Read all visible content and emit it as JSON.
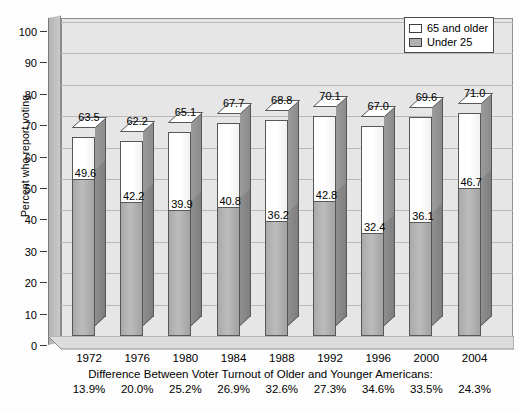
{
  "chart_data": {
    "type": "bar",
    "subtype": "stacked-3d-column",
    "title": "",
    "xlabel": "",
    "ylabel": "Percent who report voting",
    "ylim": [
      0,
      100
    ],
    "ytick_step": 10,
    "yticks": [
      0,
      10,
      20,
      30,
      40,
      50,
      60,
      70,
      80,
      90,
      100
    ],
    "grid": true,
    "grid_axis": "y",
    "legend_position": "top-right",
    "categories": [
      "1972",
      "1976",
      "1980",
      "1984",
      "1988",
      "1992",
      "1996",
      "2000",
      "2004"
    ],
    "series": [
      {
        "name": "65 and older",
        "color": "#ffffff",
        "values": [
          63.5,
          62.2,
          65.1,
          67.7,
          68.8,
          70.1,
          67.0,
          69.6,
          71.0
        ]
      },
      {
        "name": "Under 25",
        "color": "#b0b0b0",
        "values": [
          49.6,
          42.2,
          39.9,
          40.8,
          36.2,
          42.8,
          32.4,
          36.1,
          46.7
        ]
      }
    ],
    "annotations": {
      "caption": "Difference Between Voter Turnout of Older and Younger Americans:",
      "differences": [
        "13.9%",
        "20.0%",
        "25.2%",
        "26.9%",
        "32.6%",
        "27.3%",
        "34.6%",
        "33.5%",
        "24.3%"
      ]
    }
  },
  "legend": {
    "items": [
      {
        "label": "65 and older",
        "swatch_color": "#ffffff"
      },
      {
        "label": "Under 25",
        "swatch_color": "#b0b0b0"
      }
    ]
  },
  "axes": {
    "y_title": "Percent who report voting",
    "y_ticks": [
      "100",
      "90",
      "80",
      "70",
      "60",
      "50",
      "40",
      "30",
      "20",
      "10",
      "0"
    ],
    "x_ticks": [
      "1972",
      "1976",
      "1980",
      "1984",
      "1988",
      "1992",
      "1996",
      "2000",
      "2004"
    ]
  },
  "footer": {
    "caption": "Difference Between Voter Turnout of Older and Younger Americans:",
    "values": [
      "13.9%",
      "20.0%",
      "25.2%",
      "26.9%",
      "32.6%",
      "27.3%",
      "34.6%",
      "33.5%",
      "24.3%"
    ]
  },
  "bar_labels": {
    "totals": [
      "63.5",
      "62.2",
      "65.1",
      "67.7",
      "68.8",
      "70.1",
      "67.0",
      "69.6",
      "71.0"
    ],
    "inner": [
      "49.6",
      "42.2",
      "39.9",
      "40.8",
      "36.2",
      "42.8",
      "32.4",
      "36.1",
      "46.7"
    ]
  },
  "colors": {
    "plot_background": "#e6e6e6",
    "gridline": "#b9b9b9",
    "axis_line": "#3a3a3a",
    "bar_older": "#ffffff",
    "bar_under25": "#b0b0b0",
    "bar_outline": "#575757",
    "wall_3d": "#c0c0c0"
  }
}
